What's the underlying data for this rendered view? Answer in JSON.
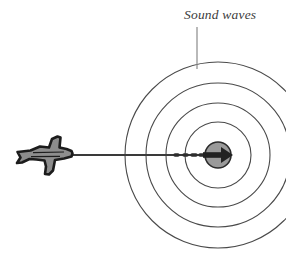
{
  "figure": {
    "background_color": "#ffffff",
    "width": 286,
    "height": 256
  },
  "annotation": {
    "label": "Sound waves",
    "label_color": "#3c3c3c",
    "leader_line_color": "#8a8a8a"
  },
  "diagram": {
    "wave_rings": {
      "name": "concentric-sound-wavefronts",
      "count": 4,
      "center_x": 218,
      "center_y": 155,
      "radii": [
        93,
        72,
        52,
        33
      ],
      "stroke_color": "#4a4a4a"
    },
    "sound_source": {
      "name": "sound-source-disc",
      "center_x": 218,
      "center_y": 155,
      "radius": 13,
      "fill_color": "#9a9a9a",
      "stroke_color": "#2b2b2b"
    },
    "aircraft": {
      "name": "jet-aircraft",
      "fill_color": "#8d8d8d",
      "outline_color": "#1c1c1c",
      "heading": "right"
    },
    "flight_path": {
      "name": "flight-path-line",
      "color": "#3a3a3a",
      "from_x": 72,
      "to_x": 218,
      "y": 155
    }
  }
}
